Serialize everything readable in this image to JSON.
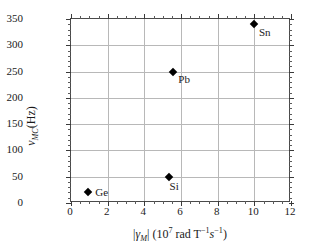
{
  "chart_data": {
    "type": "scatter",
    "title": "",
    "xlabel": "|γM| (107 rad T−1s−1)",
    "ylabel": "νMC (Hz)",
    "xlim": [
      0,
      12
    ],
    "ylim": [
      0,
      350
    ],
    "grid": true,
    "legend": "none",
    "x_ticks": [
      "0",
      "2",
      "4",
      "6",
      "8",
      "10",
      "12"
    ],
    "x_tick_values": [
      0,
      2,
      4,
      6,
      8,
      10,
      12
    ],
    "y_ticks": [
      "0",
      "50",
      "100",
      "150",
      "200",
      "250",
      "300",
      "350"
    ],
    "y_tick_values": [
      0,
      50,
      100,
      150,
      200,
      250,
      300,
      350
    ],
    "x_minor_interval": 0.5,
    "y_minor_interval": 10,
    "marker": "filled-diamond",
    "marker_color": "#000000",
    "points": [
      {
        "label": "Ge",
        "x": 0.94,
        "y": 20
      },
      {
        "label": "Si",
        "x": 5.32,
        "y": 50
      },
      {
        "label": "Pb",
        "x": 5.58,
        "y": 250
      },
      {
        "label": "Sn",
        "x": 9.98,
        "y": 340
      }
    ]
  },
  "axis_titles": {
    "y": {
      "symbol": "ν",
      "sub": "MC",
      "unit": "(Hz)"
    },
    "x": {
      "bar_open": "|",
      "symbol": "γ",
      "sub": "M",
      "bar_close": "|",
      "paren_open": "(",
      "base": "10",
      "exp": "7",
      "rad": " rad T",
      "exp_t": "−1",
      "s": "s",
      "exp_s": "−1",
      "paren_close": ")"
    }
  },
  "point_labels": {
    "ge": "Ge",
    "si": "Si",
    "pb": "Pb",
    "sn": "Sn"
  },
  "colors": {
    "background": "#ffffff",
    "frame": "#4a4a4a",
    "grid": "#b8b8b8",
    "marker": "#000000",
    "text": "#1a1a1a"
  }
}
